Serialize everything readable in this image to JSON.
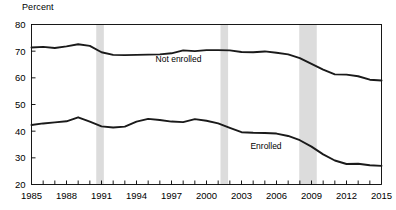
{
  "figure": {
    "axis_unit_label": "Percent",
    "background_color": "#ffffff",
    "line_color": "#1a1a1a",
    "recession_band_color": "#dcdcdc",
    "axis_color": "#000000"
  },
  "chart_data": {
    "type": "line",
    "title": "",
    "subtitle": "",
    "xlabel": "",
    "ylabel": "Percent",
    "xlim": [
      1985,
      2015
    ],
    "ylim": [
      20,
      80
    ],
    "grid": false,
    "legend_position": "inline-annotations",
    "ytick_labels": [
      "20",
      "30",
      "40",
      "50",
      "60",
      "70",
      "80"
    ],
    "ytick_values": [
      20,
      30,
      40,
      50,
      60,
      70,
      80
    ],
    "xtick_labels": [
      "1985",
      "1988",
      "1991",
      "1994",
      "1997",
      "2000",
      "2003",
      "2006",
      "2009",
      "2012",
      "2015"
    ],
    "xtick_values": [
      1985,
      1988,
      1991,
      1994,
      1997,
      2000,
      2003,
      2006,
      2009,
      2012,
      2015
    ],
    "xminor_step": 1,
    "x": [
      1985,
      1986,
      1987,
      1988,
      1989,
      1990,
      1991,
      1992,
      1993,
      1994,
      1995,
      1996,
      1997,
      1998,
      1999,
      2000,
      2001,
      2002,
      2003,
      2004,
      2005,
      2006,
      2007,
      2008,
      2009,
      2010,
      2011,
      2012,
      2013,
      2014,
      2015
    ],
    "series": [
      {
        "name": "Not enrolled",
        "label": "Not enrolled",
        "label_x": 1997.6,
        "label_y": 66.0,
        "values": [
          71.4,
          71.6,
          71.2,
          71.8,
          72.6,
          72.0,
          69.6,
          68.6,
          68.5,
          68.6,
          68.7,
          68.8,
          69.2,
          70.3,
          70.0,
          70.4,
          70.4,
          70.3,
          69.7,
          69.6,
          69.9,
          69.4,
          68.8,
          67.4,
          65.2,
          63.1,
          61.3,
          61.2,
          60.6,
          59.3,
          59.0
        ]
      },
      {
        "name": "Enrolled",
        "label": "Enrolled",
        "label_x": 2005.1,
        "label_y": 33.2,
        "values": [
          42.3,
          42.9,
          43.3,
          43.7,
          45.2,
          43.6,
          41.8,
          41.4,
          41.7,
          43.6,
          44.6,
          44.2,
          43.6,
          43.4,
          44.5,
          43.9,
          42.9,
          41.2,
          39.6,
          39.4,
          39.3,
          39.1,
          38.2,
          36.6,
          34.2,
          31.3,
          29.0,
          27.7,
          27.8,
          27.2,
          27.0
        ]
      }
    ],
    "recession_bands": [
      {
        "start": 1990.55,
        "end": 1991.2
      },
      {
        "start": 2001.2,
        "end": 2001.85
      },
      {
        "start": 2007.95,
        "end": 2009.45
      }
    ]
  }
}
